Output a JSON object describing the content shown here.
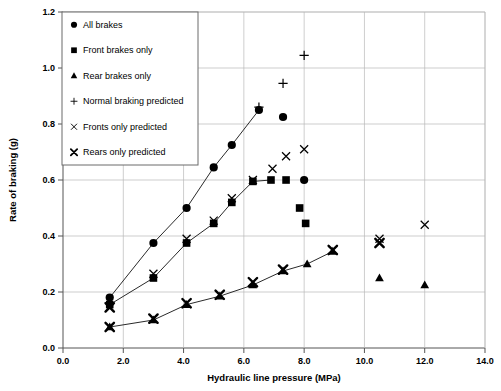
{
  "chart_data": {
    "type": "scatter",
    "title": "",
    "xlabel": "Hydraulic line pressure (MPa)",
    "ylabel": "Rate of braking (g)",
    "xlim": [
      0.0,
      14.0
    ],
    "ylim": [
      0.0,
      1.2
    ],
    "xticks": [
      "0.0",
      "2.0",
      "4.0",
      "6.0",
      "8.0",
      "10.0",
      "12.0",
      "14.0"
    ],
    "yticks": [
      "0.0",
      "0.2",
      "0.4",
      "0.6",
      "0.8",
      "1.0",
      "1.2"
    ],
    "xtick_values": [
      0.0,
      2.0,
      4.0,
      6.0,
      8.0,
      10.0,
      12.0,
      14.0
    ],
    "ytick_values": [
      0.0,
      0.2,
      0.4,
      0.6,
      0.8,
      1.0,
      1.2
    ],
    "grid": true,
    "legend_position": "top-left",
    "series": [
      {
        "name": "All brakes",
        "marker": "filled-circle",
        "connected": true,
        "points": [
          {
            "x": 1.55,
            "y": 0.18
          },
          {
            "x": 3.0,
            "y": 0.375
          },
          {
            "x": 4.1,
            "y": 0.5
          },
          {
            "x": 5.0,
            "y": 0.645
          },
          {
            "x": 5.6,
            "y": 0.725
          },
          {
            "x": 6.5,
            "y": 0.85
          }
        ],
        "extra_points": [
          {
            "x": 7.3,
            "y": 0.825
          },
          {
            "x": 8.0,
            "y": 0.6
          }
        ]
      },
      {
        "name": "Front brakes only",
        "marker": "filled-square",
        "connected": true,
        "points": [
          {
            "x": 1.55,
            "y": 0.155
          },
          {
            "x": 3.0,
            "y": 0.25
          },
          {
            "x": 4.1,
            "y": 0.375
          },
          {
            "x": 5.0,
            "y": 0.445
          },
          {
            "x": 5.6,
            "y": 0.52
          },
          {
            "x": 6.3,
            "y": 0.595
          },
          {
            "x": 6.9,
            "y": 0.6
          }
        ],
        "extra_points": [
          {
            "x": 7.4,
            "y": 0.6
          },
          {
            "x": 7.85,
            "y": 0.5
          },
          {
            "x": 8.05,
            "y": 0.445
          }
        ]
      },
      {
        "name": "Rear brakes only",
        "marker": "filled-triangle",
        "connected": true,
        "points": [
          {
            "x": 1.55,
            "y": 0.075
          },
          {
            "x": 3.0,
            "y": 0.1
          },
          {
            "x": 4.1,
            "y": 0.155
          },
          {
            "x": 5.2,
            "y": 0.185
          },
          {
            "x": 6.3,
            "y": 0.225
          },
          {
            "x": 7.3,
            "y": 0.275
          },
          {
            "x": 8.1,
            "y": 0.3
          },
          {
            "x": 8.95,
            "y": 0.345
          }
        ],
        "extra_points": [
          {
            "x": 10.5,
            "y": 0.25
          },
          {
            "x": 12.0,
            "y": 0.225
          }
        ]
      },
      {
        "name": "Normal braking predicted",
        "marker": "plus",
        "connected": false,
        "points": [
          {
            "x": 6.5,
            "y": 0.86
          },
          {
            "x": 7.3,
            "y": 0.945
          },
          {
            "x": 8.0,
            "y": 1.045
          }
        ]
      },
      {
        "name": "Fronts only predicted",
        "marker": "cross",
        "connected": false,
        "points": [
          {
            "x": 1.55,
            "y": 0.145
          },
          {
            "x": 3.0,
            "y": 0.265
          },
          {
            "x": 4.1,
            "y": 0.39
          },
          {
            "x": 5.0,
            "y": 0.455
          },
          {
            "x": 5.6,
            "y": 0.535
          },
          {
            "x": 6.3,
            "y": 0.6
          },
          {
            "x": 6.95,
            "y": 0.64
          },
          {
            "x": 7.4,
            "y": 0.685
          },
          {
            "x": 8.0,
            "y": 0.71
          },
          {
            "x": 10.5,
            "y": 0.39
          },
          {
            "x": 12.0,
            "y": 0.44
          }
        ]
      },
      {
        "name": "Rears only predicted",
        "marker": "bold-cross",
        "connected": false,
        "points": [
          {
            "x": 1.55,
            "y": 0.075
          },
          {
            "x": 1.55,
            "y": 0.145
          },
          {
            "x": 3.0,
            "y": 0.105
          },
          {
            "x": 4.1,
            "y": 0.16
          },
          {
            "x": 5.2,
            "y": 0.19
          },
          {
            "x": 6.3,
            "y": 0.235
          },
          {
            "x": 7.3,
            "y": 0.28
          },
          {
            "x": 8.95,
            "y": 0.35
          },
          {
            "x": 10.5,
            "y": 0.375
          }
        ]
      }
    ],
    "legend": [
      {
        "label": "All brakes",
        "marker": "filled-circle"
      },
      {
        "label": "Front brakes only",
        "marker": "filled-square"
      },
      {
        "label": "Rear brakes only",
        "marker": "filled-triangle"
      },
      {
        "label": "Normal braking predicted",
        "marker": "plus"
      },
      {
        "label": "Fronts only predicted",
        "marker": "cross"
      },
      {
        "label": "Rears only predicted",
        "marker": "bold-cross"
      }
    ],
    "colors": {
      "marker": "#000000",
      "line": "#2a2a2a",
      "grid": "#b8b8b8",
      "axis": "#555555",
      "background": "#ffffff"
    }
  }
}
